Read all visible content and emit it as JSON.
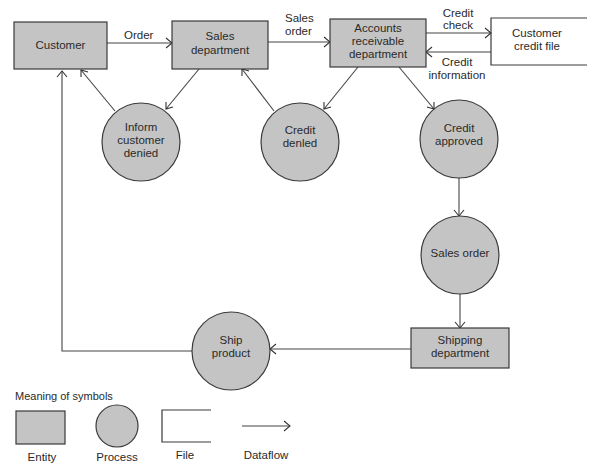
{
  "diagram": {
    "type": "data-flow-diagram",
    "colors": {
      "shape_fill": "#c4c4c4",
      "stroke": "#3a3a3a",
      "background": "#ffffff"
    },
    "entities": {
      "customer": {
        "label": [
          "Customer"
        ]
      },
      "sales_department": {
        "label": [
          "Sales",
          "department"
        ]
      },
      "accounts_receivable": {
        "label": [
          "Accounts",
          "receivable",
          "department"
        ]
      },
      "shipping_department": {
        "label": [
          "Shipping",
          "department"
        ]
      }
    },
    "files": {
      "customer_credit_file": {
        "label": [
          "Customer",
          "credit file"
        ]
      }
    },
    "processes": {
      "inform_customer_denied": {
        "label": [
          "Inform",
          "customer",
          "denied"
        ]
      },
      "credit_denied": {
        "label": [
          "Credit",
          "denled"
        ]
      },
      "credit_approved": {
        "label": [
          "Credit",
          "approved"
        ]
      },
      "sales_order": {
        "label": [
          "Sales order"
        ]
      },
      "ship_product": {
        "label": [
          "Ship",
          "product"
        ]
      }
    },
    "flows": {
      "order": {
        "label": [
          "Order"
        ]
      },
      "sales_order": {
        "label": [
          "Sales",
          "order"
        ]
      },
      "credit_check": {
        "label": [
          "Credit",
          "check"
        ]
      },
      "credit_information": {
        "label": [
          "Credit",
          "information"
        ]
      }
    }
  },
  "legend": {
    "title": "Meaning of symbols",
    "entity": "Entity",
    "process": "Process",
    "file": "File",
    "dataflow": "Dataflow"
  }
}
